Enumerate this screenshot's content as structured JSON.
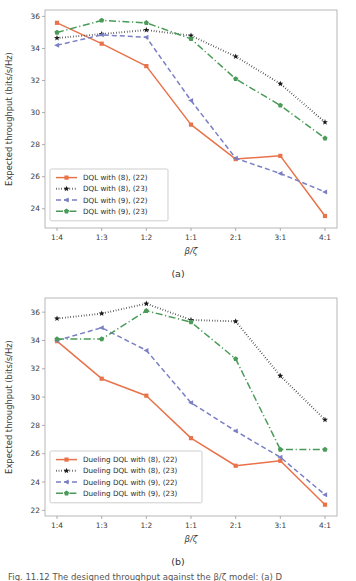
{
  "figure": {
    "panel_a_caption": "(a)",
    "panel_b_caption": "(b)",
    "bottom_caption_partial": "Fig. 11.12 The designed throughput against the β/ζ model: (a) D"
  },
  "chart_data": [
    {
      "type": "line",
      "panel": "(a)",
      "title": "",
      "xlabel": "β/ζ",
      "ylabel": "Expected throughput (bits/s/Hz)",
      "categories": [
        "1:4",
        "1:3",
        "1:2",
        "1:1",
        "2:1",
        "3:1",
        "4:1"
      ],
      "ylim": [
        22.8,
        36.4
      ],
      "yticks": [
        24,
        26,
        28,
        30,
        32,
        34,
        36
      ],
      "grid": false,
      "legend_position": "lower left",
      "series": [
        {
          "name": "DQL with (8), (22)",
          "color": "#e8734a",
          "linestyle": "solid",
          "marker": "square",
          "values": [
            35.6,
            34.3,
            32.9,
            29.25,
            27.1,
            27.3,
            23.55
          ]
        },
        {
          "name": "DQL with (8), (23)",
          "color": "#1a1a1a",
          "linestyle": "dotted",
          "marker": "star",
          "values": [
            34.65,
            34.9,
            35.15,
            34.8,
            33.5,
            31.8,
            29.4
          ]
        },
        {
          "name": "DQL with (9), (22)",
          "color": "#7b7fc4",
          "linestyle": "dashed",
          "marker": "triangle-left",
          "values": [
            34.2,
            34.85,
            34.7,
            30.75,
            27.15,
            26.2,
            25.05
          ]
        },
        {
          "name": "DQL with (9), (23)",
          "color": "#4a9a58",
          "linestyle": "dashdot",
          "marker": "pentagon",
          "values": [
            35.0,
            35.75,
            35.6,
            34.6,
            32.1,
            30.45,
            28.4
          ]
        }
      ]
    },
    {
      "type": "line",
      "panel": "(b)",
      "title": "",
      "xlabel": "β/ζ",
      "ylabel": "Expected throughput (bits/s/Hz)",
      "categories": [
        "1:4",
        "1:3",
        "1:2",
        "1:1",
        "2:1",
        "3:1",
        "4:1"
      ],
      "ylim": [
        21.6,
        37.0
      ],
      "yticks": [
        22,
        24,
        26,
        28,
        30,
        32,
        34,
        36
      ],
      "grid": false,
      "legend_position": "lower left",
      "series": [
        {
          "name": "Dueling DQL with (8), (22)",
          "color": "#e8734a",
          "linestyle": "solid",
          "marker": "square",
          "values": [
            33.95,
            31.3,
            30.1,
            27.1,
            25.15,
            25.5,
            22.4
          ]
        },
        {
          "name": "Dueling DQL with (8), (23)",
          "color": "#1a1a1a",
          "linestyle": "dotted",
          "marker": "star",
          "values": [
            35.55,
            35.9,
            36.6,
            35.45,
            35.35,
            31.5,
            28.4
          ]
        },
        {
          "name": "Dueling DQL with (9), (22)",
          "color": "#7b7fc4",
          "linestyle": "dashed",
          "marker": "triangle-left",
          "values": [
            34.0,
            34.9,
            33.3,
            29.6,
            27.6,
            25.75,
            23.1
          ]
        },
        {
          "name": "Dueling DQL with (9), (23)",
          "color": "#4a9a58",
          "linestyle": "dashdot",
          "marker": "pentagon",
          "values": [
            34.1,
            34.1,
            36.1,
            35.3,
            32.7,
            26.3,
            26.3
          ]
        }
      ]
    }
  ]
}
